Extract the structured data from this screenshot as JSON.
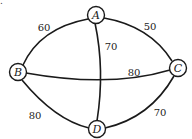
{
  "diagram": {
    "corner_mark": ".",
    "nodes": [
      {
        "id": "A",
        "label": "A",
        "x": 96,
        "y": 15
      },
      {
        "id": "B",
        "label": "B",
        "x": 18,
        "y": 72
      },
      {
        "id": "C",
        "label": "C",
        "x": 178,
        "y": 68
      },
      {
        "id": "D",
        "label": "D",
        "x": 97,
        "y": 129
      }
    ],
    "edges": [
      {
        "from": "A",
        "to": "B",
        "weight": "60"
      },
      {
        "from": "A",
        "to": "C",
        "weight": "50"
      },
      {
        "from": "A",
        "to": "D",
        "weight": "70"
      },
      {
        "from": "B",
        "to": "C",
        "weight": "80"
      },
      {
        "from": "B",
        "to": "D",
        "weight": "80"
      },
      {
        "from": "C",
        "to": "D",
        "weight": "70"
      }
    ]
  }
}
